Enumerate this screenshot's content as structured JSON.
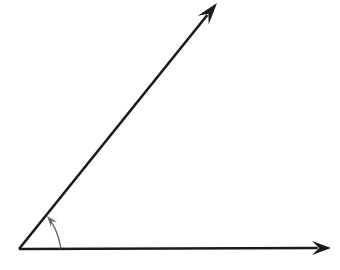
{
  "figure": {
    "background_color": "#ffffff",
    "width": 340,
    "height": 270,
    "vertex": {
      "x": 19,
      "y": 249,
      "label": ""
    },
    "stroke_color": "#1a1a1a",
    "arc_color": "#6b6b6b",
    "ray_stroke_width": 2.6,
    "arc_stroke_width": 1.4
  },
  "rays": [
    {
      "name": "horizontal-ray",
      "from": {
        "x": 19,
        "y": 249
      },
      "to": {
        "x": 331,
        "y": 248
      },
      "direction_degrees": 0,
      "arrowhead": "filled-concave-dart",
      "arrow_tip": {
        "x": 331,
        "y": 248
      },
      "arrow_length": 19,
      "arrow_half_width": 7,
      "color": "#1a1a1a"
    },
    {
      "name": "diagonal-ray",
      "from": {
        "x": 19,
        "y": 249
      },
      "to": {
        "x": 217,
        "y": 3
      },
      "direction_degrees": 51.2,
      "arrowhead": "filled-concave-dart",
      "arrow_tip": {
        "x": 217,
        "y": 3
      },
      "arrow_length": 22,
      "arrow_half_width": 7,
      "color": "#1a1a1a"
    }
  ],
  "angle_marker": {
    "name": "angle-arc-arrow",
    "type": "curved-arrow",
    "start": {
      "x": 61,
      "y": 248
    },
    "control": {
      "x": 57,
      "y": 228
    },
    "end": {
      "x": 49,
      "y": 219
    },
    "arrow_tip": {
      "x": 47,
      "y": 216
    },
    "arrow_length": 11,
    "arrow_half_width": 4,
    "color": "#6b6b6b",
    "measure_label": ""
  },
  "labels": []
}
